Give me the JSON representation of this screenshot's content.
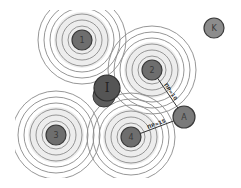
{
  "diagram": {
    "type": "signal-coverage",
    "colors": {
      "ring": "#8a8a8a",
      "ring_fill": "#d6d6d6",
      "node_fill": "#6e6e6e",
      "node_stroke": "#3a3a3a",
      "target_fill": "#7a7a7a",
      "k_fill": "#8c8c8c"
    },
    "stations": [
      {
        "id": "1",
        "label": "1",
        "x": 82,
        "y": 40
      },
      {
        "id": "2",
        "label": "2",
        "x": 152,
        "y": 70
      },
      {
        "id": "3",
        "label": "3",
        "x": 56,
        "y": 135
      },
      {
        "id": "4",
        "label": "4",
        "x": 131,
        "y": 137
      }
    ],
    "interference": {
      "id": "I",
      "label": "I",
      "x": 107,
      "y": 88
    },
    "target": {
      "id": "A",
      "label": "A",
      "x": 184,
      "y": 117
    },
    "outlier": {
      "id": "K",
      "label": "K",
      "x": 214,
      "y": 28
    },
    "edges": [
      {
        "from": "2",
        "to": "A",
        "label": "ПР=10"
      },
      {
        "from": "4",
        "to": "A",
        "label": "ПР=15"
      }
    ]
  }
}
